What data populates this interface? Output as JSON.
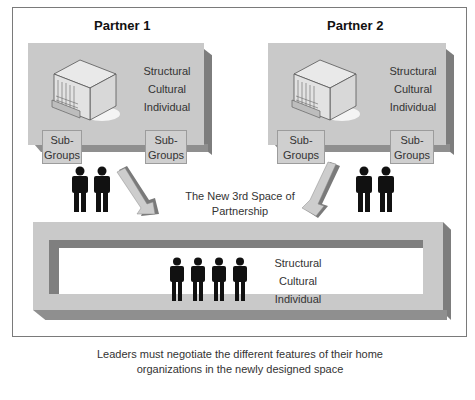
{
  "partners": [
    {
      "title": "Partner 1",
      "features": [
        "Structural",
        "Cultural",
        "Individual"
      ],
      "subgroups": [
        "Sub-\nGroups",
        "Sub-\nGroups"
      ],
      "subgroup_lines": [
        [
          "Sub-",
          "Groups"
        ],
        [
          "Sub-",
          "Groups"
        ]
      ],
      "people_count": 2
    },
    {
      "title": "Partner 2",
      "features": [
        "Structural",
        "Cultural",
        "Individual"
      ],
      "subgroup_lines": [
        [
          "Sub-",
          "Groups"
        ],
        [
          "Sub-",
          "Groups"
        ]
      ],
      "people_count": 2
    }
  ],
  "third_space": {
    "label_lines": [
      "The New 3rd Space of",
      "Partnership"
    ],
    "features": [
      "Structural",
      "Cultural",
      "Individual"
    ],
    "people_count": 4
  },
  "caption_lines": [
    "Leaders must negotiate the different features of their home",
    "organizations in the newly designed space"
  ],
  "colors": {
    "panel": "#c9c9c9",
    "panel_shadow": "#7d7d7d",
    "arrow_light": "#c8c8c8",
    "arrow_dark": "#777777",
    "people": "#111111"
  }
}
